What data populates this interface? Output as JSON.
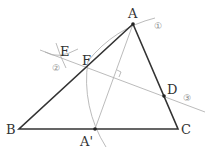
{
  "diagram": {
    "type": "geometry-construction",
    "points": {
      "A": {
        "label": "A",
        "x": 133,
        "y": 24
      },
      "B": {
        "label": "B",
        "x": 19,
        "y": 129
      },
      "C": {
        "label": "C",
        "x": 178,
        "y": 129
      },
      "A_prime": {
        "label": "A'",
        "x": 95,
        "y": 129
      },
      "D": {
        "label": "D",
        "x": 164,
        "y": 96
      },
      "E": {
        "label": "E",
        "x": 59,
        "y": 57
      },
      "F": {
        "label": "F",
        "x": 90,
        "y": 68
      }
    },
    "step_markers": {
      "step1": "①",
      "step2": "②",
      "step3": "③"
    },
    "colors": {
      "triangle": "#333333",
      "construction": "#aaaaaa",
      "text": "#333333"
    }
  }
}
